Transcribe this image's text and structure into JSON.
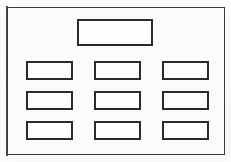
{
  "figure": {
    "background_color": "#f7f7f5",
    "stroke_color": "#2a2a2a",
    "frame_color": "#3b3b3b",
    "box_fill": "#fefefe",
    "header_box": {
      "label": "",
      "x": 77,
      "y": 19,
      "width": 76,
      "height": 27
    },
    "grid": {
      "rows": 3,
      "columns": 3,
      "cell_width": 47,
      "cell_height": 19,
      "column_x": [
        26,
        94,
        162
      ],
      "row_y": [
        61,
        91,
        121
      ],
      "cells": [
        {
          "row": 1,
          "column": 1,
          "label": ""
        },
        {
          "row": 1,
          "column": 2,
          "label": ""
        },
        {
          "row": 1,
          "column": 3,
          "label": ""
        },
        {
          "row": 2,
          "column": 1,
          "label": ""
        },
        {
          "row": 2,
          "column": 2,
          "label": ""
        },
        {
          "row": 2,
          "column": 3,
          "label": ""
        },
        {
          "row": 3,
          "column": 1,
          "label": ""
        },
        {
          "row": 3,
          "column": 2,
          "label": ""
        },
        {
          "row": 3,
          "column": 3,
          "label": ""
        }
      ]
    }
  }
}
